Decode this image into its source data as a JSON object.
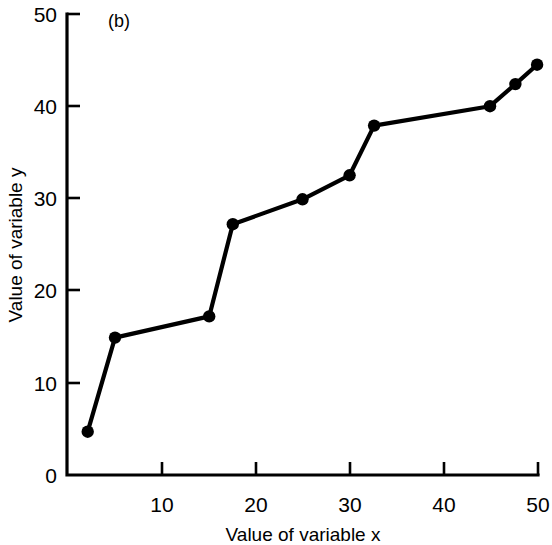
{
  "figure": {
    "panel_label": "(b)",
    "background_color": "#ffffff",
    "ink_color": "#000000"
  },
  "chart_data": {
    "type": "line",
    "title": "",
    "subtitle": "",
    "panel_label": "(b)",
    "xlabel": "Value of variable x",
    "ylabel": "Value of variable y",
    "xlim": [
      0,
      50
    ],
    "ylim": [
      0,
      50
    ],
    "xticks": [
      10,
      20,
      30,
      40,
      50
    ],
    "yticks": [
      0,
      10,
      20,
      30,
      40,
      50
    ],
    "xticklabels": [
      "10",
      "20",
      "30",
      "40",
      "50"
    ],
    "yticklabels": [
      "0",
      "10",
      "20",
      "30",
      "40",
      "50"
    ],
    "grid": false,
    "legend": null,
    "marker": "filled-circle",
    "line_color": "#000000",
    "marker_color": "#000000",
    "x": [
      2.2,
      5.1,
      15.1,
      17.6,
      25.0,
      30.0,
      32.6,
      44.9,
      47.6,
      49.9
    ],
    "y": [
      4.7,
      14.9,
      17.2,
      27.2,
      29.9,
      32.5,
      37.9,
      40.0,
      42.4,
      44.5
    ],
    "points": [
      {
        "x": 2.2,
        "y": 4.7
      },
      {
        "x": 5.1,
        "y": 14.9
      },
      {
        "x": 15.1,
        "y": 17.2
      },
      {
        "x": 17.6,
        "y": 27.2
      },
      {
        "x": 25.0,
        "y": 29.9
      },
      {
        "x": 30.0,
        "y": 32.5
      },
      {
        "x": 32.6,
        "y": 37.9
      },
      {
        "x": 44.9,
        "y": 40.0
      },
      {
        "x": 47.6,
        "y": 42.4
      },
      {
        "x": 49.9,
        "y": 44.5
      }
    ],
    "annotations": []
  }
}
